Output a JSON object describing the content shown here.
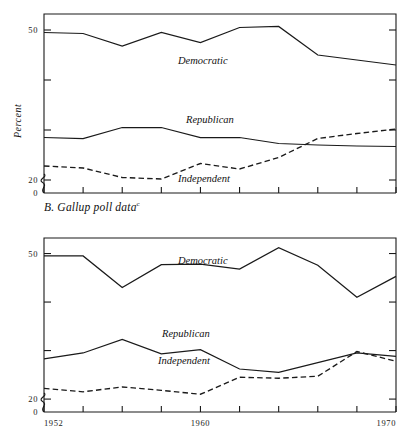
{
  "figure": {
    "panels": [
      {
        "id": "A",
        "caption": "",
        "caption_note": "",
        "ylabel": "Percent",
        "yticks_labeled": [
          "50",
          "20",
          "0"
        ],
        "yticks_unlabeled": [
          "40",
          "30"
        ],
        "xticks_labeled": [
          "",
          "",
          ""
        ],
        "series_labels": {
          "democratic": "Democratic",
          "republican": "Republican",
          "independent": "Independent"
        }
      },
      {
        "id": "B",
        "caption": "B. Gallup poll data",
        "caption_note": "c",
        "ylabel": "Percent",
        "yticks_labeled": [
          "50",
          "20",
          "0"
        ],
        "yticks_unlabeled": [
          "40",
          "30"
        ],
        "xticks_labeled": [
          "1952",
          "1960",
          "1970"
        ],
        "series_labels": {
          "democratic": "Democratic",
          "republican": "Republican",
          "independent": "Independent"
        }
      }
    ]
  },
  "chart_data": [
    {
      "type": "line",
      "title": "",
      "panel": "A",
      "xlabel": "",
      "ylabel": "Percent",
      "xlim": [
        1952,
        1970
      ],
      "ylim": [
        20,
        53
      ],
      "axis_break_below": 20,
      "grid": false,
      "legend": "inline-annotations",
      "x": [
        1952,
        1954,
        1956,
        1958,
        1960,
        1962,
        1964,
        1966,
        1968,
        1970
      ],
      "series": [
        {
          "name": "Democratic",
          "style": "solid",
          "values": [
            49.5,
            49.3,
            46.8,
            49.5,
            47.5,
            50.5,
            50.7,
            45.0,
            44.0,
            43.0
          ]
        },
        {
          "name": "Republican",
          "style": "solid",
          "values": [
            28.5,
            28.3,
            30.5,
            30.5,
            28.5,
            28.5,
            27.3,
            27.0,
            26.8,
            26.7
          ]
        },
        {
          "name": "Independent",
          "style": "dashed",
          "values": [
            22.8,
            22.4,
            20.5,
            20.2,
            23.3,
            22.2,
            24.5,
            28.3,
            29.3,
            30.2
          ]
        }
      ]
    },
    {
      "type": "line",
      "title": "B. Gallup poll data",
      "panel": "B",
      "xlabel": "",
      "ylabel": "Percent",
      "xlim": [
        1952,
        1970
      ],
      "ylim": [
        20,
        53
      ],
      "axis_break_below": 20,
      "grid": false,
      "legend": "inline-annotations",
      "x": [
        1952,
        1954,
        1956,
        1958,
        1960,
        1962,
        1964,
        1966,
        1968,
        1970
      ],
      "series": [
        {
          "name": "Democratic",
          "style": "solid",
          "values": [
            49.5,
            49.5,
            43.0,
            47.7,
            47.8,
            46.8,
            51.2,
            47.6,
            41.0,
            45.3
          ]
        },
        {
          "name": "Republican",
          "style": "solid",
          "values": [
            28.3,
            29.5,
            32.3,
            29.3,
            30.2,
            26.2,
            25.5,
            27.5,
            29.5,
            28.8
          ]
        },
        {
          "name": "Independent",
          "style": "dashed",
          "values": [
            22.2,
            21.5,
            22.5,
            21.8,
            21.0,
            24.5,
            24.3,
            24.7,
            29.8,
            27.8
          ]
        }
      ]
    }
  ]
}
